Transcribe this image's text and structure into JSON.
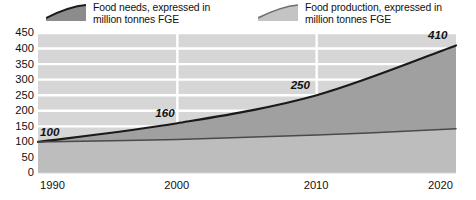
{
  "chart_data": {
    "type": "area",
    "title": "",
    "xlabel": "",
    "ylabel": "",
    "x": [
      1990,
      2000,
      2010,
      2020
    ],
    "xlim": [
      1990,
      2020
    ],
    "ylim": [
      0,
      450
    ],
    "grid": "horizontal-and-vertical-white-gridlines-on-gray-bands",
    "legend_position": "top",
    "x_ticks": [
      "1990",
      "2000",
      "2010",
      "2020"
    ],
    "y_ticks": [
      "0",
      "50",
      "100",
      "150",
      "200",
      "250",
      "300",
      "350",
      "400",
      "450"
    ],
    "series": [
      {
        "name": "Food needs, expressed in\nmillion tonnes FGE",
        "legend_label_line1": "Food needs, expressed in",
        "legend_label_line2": "million tonnes FGE",
        "values": [
          100,
          160,
          250,
          410
        ],
        "point_labels": [
          "100",
          "160",
          "250",
          "410"
        ],
        "fill_color": "#a0a0a0",
        "line_color": "#1a1a1a",
        "swatch_fill": "#8c8c8c",
        "swatch_line": "#1a1a1a"
      },
      {
        "name": "Food production, expressed in\nmillion tonnes FGE",
        "legend_label_line1": "Food production, expressed in",
        "legend_label_line2": "million tonnes FGE",
        "values": [
          100,
          108,
          122,
          142
        ],
        "point_labels": [],
        "fill_color": "#bdbdbd",
        "line_color": "#4a4a4a",
        "swatch_fill": "#c4c4c4",
        "swatch_line": "#6e6e6e"
      }
    ],
    "annotations": [
      {
        "text": "100",
        "x": 1990,
        "y": 100
      },
      {
        "text": "160",
        "x": 2000,
        "y": 160
      },
      {
        "text": "250",
        "x": 2010,
        "y": 250
      },
      {
        "text": "410",
        "x": 2020,
        "y": 410
      }
    ],
    "colors": {
      "plot_background": "#d6d6d6",
      "gridline": "#ffffff",
      "text": "#111111"
    }
  },
  "legend": {
    "entries": [
      {
        "line1": "Food needs, expressed in",
        "line2": "million tonnes FGE"
      },
      {
        "line1": "Food production, expressed in",
        "line2": "million tonnes FGE"
      }
    ]
  }
}
